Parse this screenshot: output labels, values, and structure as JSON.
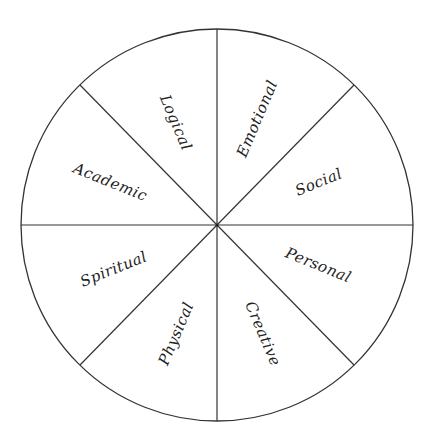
{
  "diagram": {
    "type": "wheel",
    "segments": [
      {
        "label": "Emotional"
      },
      {
        "label": "Social"
      },
      {
        "label": "Personal"
      },
      {
        "label": "Creative"
      },
      {
        "label": "Physical"
      },
      {
        "label": "Spiritual"
      },
      {
        "label": "Academic"
      },
      {
        "label": "Logical"
      }
    ],
    "line_color": "#333333",
    "text_color": "#222222"
  }
}
